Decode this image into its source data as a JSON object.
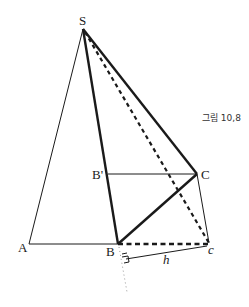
{
  "figure": {
    "caption": "그림 10,8",
    "colors": {
      "stroke": "#1a1a1a",
      "dotted": "#999999",
      "background": "#ffffff"
    },
    "points": {
      "S": {
        "label": "S",
        "x": 83,
        "y": 29
      },
      "A": {
        "label": "A",
        "x": 29,
        "y": 244
      },
      "B": {
        "label": "B",
        "x": 118,
        "y": 244
      },
      "B_prime": {
        "label": "B'",
        "x": 108,
        "y": 174
      },
      "C": {
        "label": "C",
        "x": 197,
        "y": 174
      },
      "c": {
        "label": "c",
        "x": 209,
        "y": 243
      }
    },
    "distance_label": "h"
  }
}
